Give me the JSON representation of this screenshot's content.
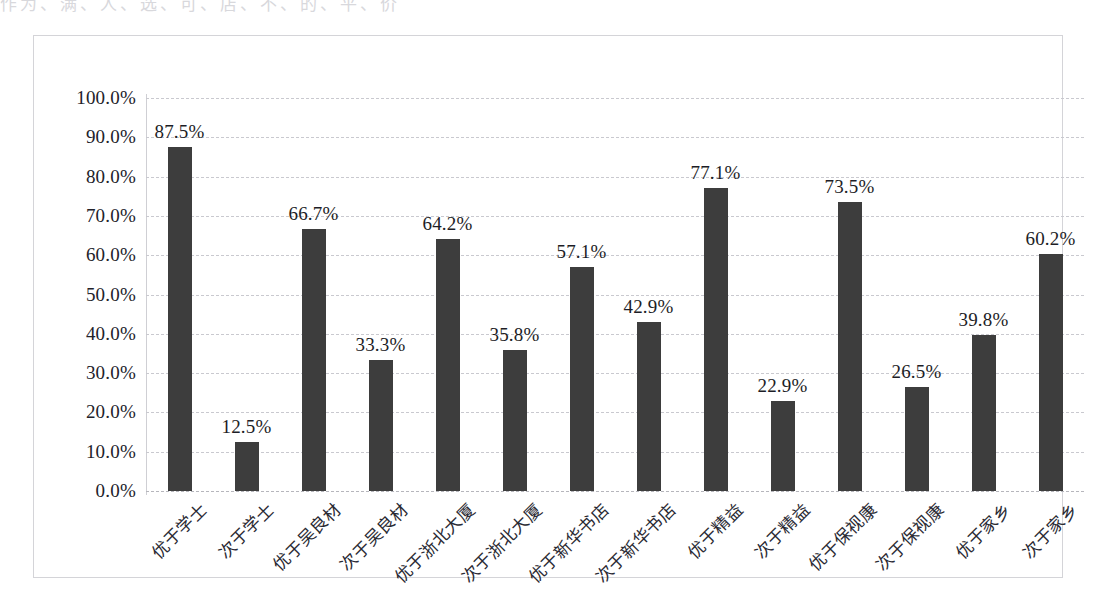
{
  "scan": {
    "top_remnant": "作为、满、人、选、可、店、不、的、平、价"
  },
  "chart_data": {
    "type": "bar",
    "title": "",
    "subtitle": "",
    "xlabel": "",
    "ylabel": "",
    "ylim": [
      0,
      100
    ],
    "y_tick_labels": [
      "100.0%",
      "90.0%",
      "80.0%",
      "70.0%",
      "60.0%",
      "50.0%",
      "40.0%",
      "30.0%",
      "20.0%",
      "10.0%",
      "0.0%"
    ],
    "y_ticks": [
      100,
      90,
      80,
      70,
      60,
      50,
      40,
      30,
      20,
      10,
      0
    ],
    "grid": true,
    "legend": "none",
    "bar_color": "#3d3d3d",
    "grid_color": "#c9c9cf",
    "categories": [
      "优于学士",
      "次于学士",
      "优于吴良材",
      "次于吴良材",
      "优于浙北大厦",
      "次于浙北大厦",
      "优于新华书店",
      "次于新华书店",
      "优于精益",
      "次于精益",
      "优于保视康",
      "次于保视康",
      "优于家乡",
      "次于家乡"
    ],
    "values": [
      87.5,
      12.5,
      66.7,
      33.3,
      64.2,
      35.8,
      57.1,
      42.9,
      77.1,
      22.9,
      73.5,
      26.5,
      39.8,
      60.2
    ],
    "value_labels": [
      "87.5%",
      "12.5%",
      "66.7%",
      "33.3%",
      "64.2%",
      "35.8%",
      "57.1%",
      "42.9%",
      "77.1%",
      "22.9%",
      "73.5%",
      "26.5%",
      "39.8%",
      "60.2%"
    ]
  }
}
